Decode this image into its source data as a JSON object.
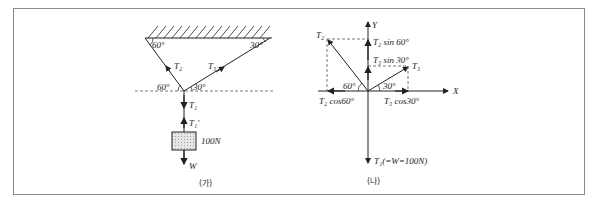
{
  "figure_a": {
    "caption": "(가)",
    "angle_top_left": "60°",
    "angle_top_right": "30°",
    "angle_bottom_left": "60°",
    "angle_bottom_right": "30°",
    "rope_left_label": "T₂",
    "rope_right_label": "T₃",
    "tension_down_label": "T₁",
    "tension_up_label": "T₁'",
    "mass_label": "100N",
    "weight_label": "W"
  },
  "figure_b": {
    "caption": "(나)",
    "y_axis_label": "Y",
    "x_axis_label": "X",
    "t2_label": "T₂",
    "t3_label": "T₃",
    "t2_sin_label": "T₂ sin 60°",
    "t3_sin_label": "T₃ sin 30°",
    "t2_cos_label": "T₂ cos60°",
    "t3_cos_label": "T₃ cos30°",
    "angle_left": "60°",
    "angle_right": "30°",
    "t1_label": "T₁(=W=100N)"
  },
  "colors": {
    "line": "#222222",
    "dashed": "#555555",
    "box_fill": "#d8d8d8",
    "frame": "#8a8a8a"
  }
}
